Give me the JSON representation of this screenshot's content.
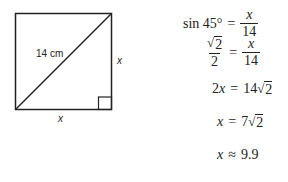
{
  "figure": {
    "shape": "square",
    "diagonal_label": "14 cm",
    "right_side_label": "x",
    "bottom_side_label": "x",
    "right_angle_marker": "bottom-right"
  },
  "equations": [
    {
      "lhs": "sin 45°",
      "op": "=",
      "rhs_num": "x",
      "rhs_den": "14"
    },
    {
      "lhs_num": "√2",
      "lhs_den": "2",
      "op": "=",
      "rhs_num": "x",
      "rhs_den": "14"
    },
    {
      "lhs": "2x",
      "op": "=",
      "rhs": "14√2"
    },
    {
      "lhs": "x",
      "op": "=",
      "rhs": "7√2"
    },
    {
      "lhs": "x",
      "op": "≈",
      "rhs": "9.9"
    }
  ],
  "text": {
    "eq1_lhs": "sin 45°",
    "eq_op": "=",
    "approx_op": "≈",
    "x": "x",
    "fourteen": "14",
    "sqrt_sym": "√",
    "two": "2",
    "two_x": "2x",
    "fourteen_coef": "14",
    "seven": "7",
    "approx_value": "9.9"
  }
}
